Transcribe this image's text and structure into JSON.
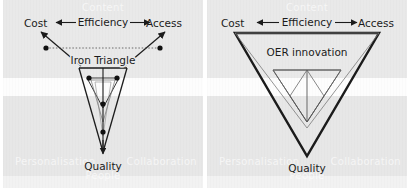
{
  "figure": {
    "width": 407,
    "height": 188,
    "background_color": "#e9e9e9",
    "line_color": "#1b1b1b"
  },
  "panels": [
    {
      "id": "iron-triangle",
      "center_label": "Iron Triangle",
      "corners": {
        "top_left": "Cost",
        "top_right": "Access",
        "bottom": "Quality"
      },
      "axis_label": "Efficiency",
      "axis_arrow_left": "⟵",
      "axis_arrow_right": "⟶",
      "shape_note": "collapsed narrow funnel with outward arrowheads and vertex dots"
    },
    {
      "id": "oer-innovation",
      "center_label": "OER innovation",
      "corners": {
        "top_left": "Cost",
        "top_right": "Access",
        "bottom": "Quality"
      },
      "axis_label": "Efficiency",
      "axis_arrow_left": "⟵",
      "axis_arrow_right": "⟶",
      "shape_note": "wide expanded bold triangle with inner inverted triangle"
    }
  ],
  "watermarks": {
    "top": "Content",
    "left": "Personalisation",
    "right": "Collaboration",
    "bottom": "People"
  }
}
